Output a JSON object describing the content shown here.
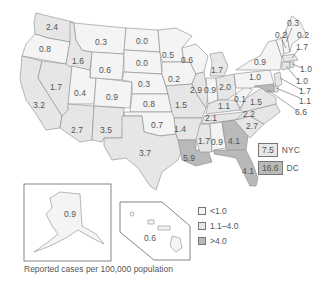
{
  "map": {
    "type": "choropleth",
    "region": "United States",
    "caption": "Reported cases per 100,000 population",
    "legend": [
      {
        "label": "<1.0",
        "color": "#f4f4f4"
      },
      {
        "label": "1.1–4.0",
        "color": "#e6e6e6"
      },
      {
        "label": ">4.0",
        "color": "#b9b9b9"
      }
    ],
    "callouts": [
      {
        "label": "NYC",
        "value": "7.5",
        "color": "#e6e6e6"
      },
      {
        "label": "DC",
        "value": "16.6",
        "color": "#b9b9b9"
      }
    ],
    "states": {
      "WA": "2.4",
      "OR": "0.8",
      "CA": "3.2",
      "NV": "1.7",
      "ID": "1.6",
      "MT": "0.3",
      "WY": "0.6",
      "UT": "0.4",
      "AZ": "2.7",
      "CO": "0.9",
      "NM": "3.5",
      "ND": "0.0",
      "SD": "0.0",
      "NE": "0.3",
      "KS": "0.8",
      "OK": "0.7",
      "TX": "3.7",
      "MN": "0.5",
      "IA": "0.2",
      "MO": "1.5",
      "AR": "1.4",
      "LA": "5.9",
      "WI": "0.6",
      "IL": "2.9",
      "MI": "1.7",
      "IN": "0.9",
      "OH": "2.0",
      "KY": "1.1",
      "TN": "2.1",
      "MS": "1.7",
      "AL": "0.9",
      "GA": "4.1",
      "FL": "4.1",
      "SC": "2.7",
      "NC": "2.2",
      "VA": "1.5",
      "WV": "0.1",
      "PA": "1.0",
      "NY": "0.9",
      "ME": "0.2",
      "NH": "0.2",
      "VT": "0.3",
      "MA": "1.7",
      "RI": "1.0",
      "CT": "1.0",
      "NJ": "1.7",
      "DE": "1.1",
      "MD": "6.6",
      "AK": "0.9",
      "HI": "0.6"
    }
  }
}
